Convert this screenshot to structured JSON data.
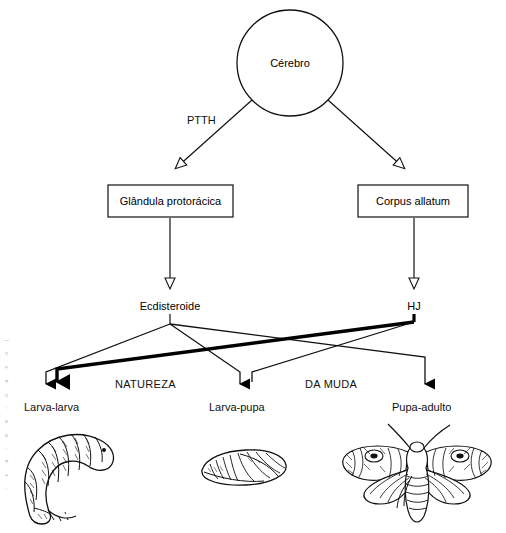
{
  "figure": {
    "language": "pt-BR"
  },
  "nodes": {
    "brain": {
      "label": "Cérebro",
      "shape": "circle",
      "cx": 290,
      "cy": 63,
      "r": 53
    },
    "prothoracic_gland": {
      "label": "Glândula protorácica",
      "shape": "box",
      "italic": false
    },
    "corpus_allatum": {
      "label": "Corpus allatum",
      "shape": "box",
      "italic": true
    },
    "ecdysteroid": {
      "label": "Ecdisteroide",
      "shape": "text"
    },
    "jh": {
      "label": "HJ",
      "shape": "text"
    }
  },
  "edge_labels": {
    "ptth": "PTTH",
    "natureza": "NATUREZA",
    "da_muda": "DA MUDA"
  },
  "outcomes": [
    {
      "label": "Larva-larva",
      "illustration": "larva-drawing"
    },
    {
      "label": "Larva-pupa",
      "illustration": "pupa-drawing"
    },
    {
      "label": "Pupa-adulto",
      "illustration": "moth-drawing"
    }
  ],
  "illustration_names": {
    "larva": "larva-caterpillar-illustration",
    "pupa": "pupa-chrysalis-illustration",
    "adult": "adult-moth-illustration"
  },
  "colors": {
    "stroke": "#000000",
    "background": "#ffffff",
    "text": "#111111"
  },
  "margin_artifact": [
    "|",
    "o",
    "s",
    "a",
    "o",
    "-",
    "e",
    "e",
    "-",
    "a",
    "+",
    "-"
  ]
}
